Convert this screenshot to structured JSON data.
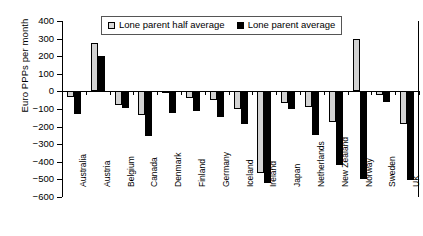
{
  "chart_data": {
    "type": "bar",
    "title": "",
    "xlabel": "",
    "ylabel": "Euro PPPs per month",
    "ylim": [
      -600,
      400
    ],
    "ytick_step": 100,
    "yticks": [
      "400",
      "300",
      "200",
      "100",
      "0",
      "-100",
      "-200",
      "-300",
      "-400",
      "-500",
      "-600"
    ],
    "grid": false,
    "legend_position": "top-center",
    "categories": [
      "Australia",
      "Austria",
      "Belgium",
      "Canada",
      "Denmark",
      "Finland",
      "Germany",
      "Iceland",
      "Ireland",
      "Japan",
      "Netherlands",
      "New Zealand",
      "Norway",
      "Sweden",
      "UK"
    ],
    "series": [
      {
        "name": "Lone parent half average",
        "color": "#d3d3d3",
        "values": [
          -30,
          275,
          -75,
          -135,
          -10,
          -35,
          -50,
          -100,
          -465,
          -65,
          -90,
          -175,
          295,
          -20,
          -185
        ]
      },
      {
        "name": "Lone parent average",
        "color": "#000000",
        "values": [
          -130,
          200,
          -95,
          -255,
          -120,
          -110,
          -145,
          -185,
          -520,
          -100,
          -250,
          -420,
          -500,
          -60,
          -505
        ]
      }
    ]
  },
  "legend": {
    "items": [
      {
        "label": "Lone parent half average",
        "swatch": "light"
      },
      {
        "label": "Lone parent average",
        "swatch": "dark"
      }
    ]
  },
  "axes": {
    "y_title": "Euro PPPs per month"
  },
  "ghost_title": ""
}
